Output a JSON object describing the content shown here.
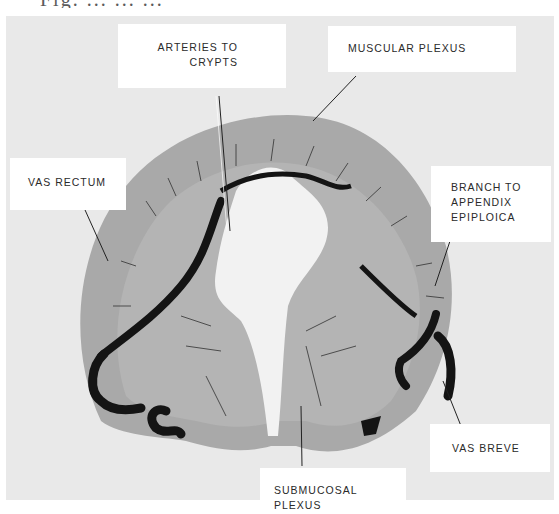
{
  "caption": {
    "partial_text": "Fig. ... ... ...",
    "note": "top caption line clipped"
  },
  "figure": {
    "type": "arteriograph cross-section (colon)",
    "labels": [
      {
        "id": "arteries-to-crypts",
        "lines": [
          "ARTERIES TO",
          "CRYPTS"
        ]
      },
      {
        "id": "muscular-plexus",
        "lines": [
          "MUSCULAR PLEXUS"
        ]
      },
      {
        "id": "vas-rectum",
        "lines": [
          "VAS RECTUM"
        ]
      },
      {
        "id": "branch-to-appendix-epiploica",
        "lines": [
          "BRANCH TO",
          "APPENDIX",
          "EPIPLOICA"
        ]
      },
      {
        "id": "vas-breve",
        "lines": [
          "VAS BREVE"
        ]
      },
      {
        "id": "submucosal-plexus",
        "lines": [
          "SUBMUCOSAL",
          "PLEXUS"
        ]
      }
    ],
    "colors": {
      "background": "#e9e9e9",
      "tissue": "#a9a9a9",
      "vessel": "#141414",
      "label_bg": "#ffffff",
      "text": "#2a2a2a"
    }
  }
}
